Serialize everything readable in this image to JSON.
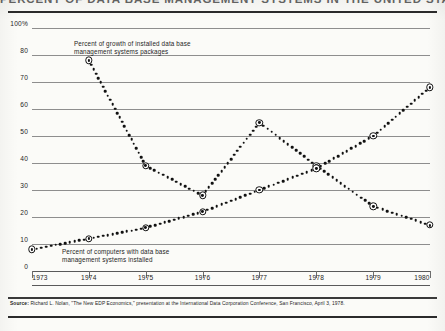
{
  "title": "PERCENT OF DATA BASE MANAGEMENT SYSTEMS IN THE UNITED STATES",
  "source_label": "Source:",
  "source_text": " Richard L. Nolan, \"The New EDP Economics,\" presentation at the International Data Corporation Conference, San Francisco, April 3, 1978.",
  "chart_data": {
    "type": "line",
    "title": "PERCENT OF DATA BASE MANAGEMENT SYSTEMS IN THE UNITED STATES",
    "xlabel": "",
    "ylabel": "",
    "xlim": [
      1973,
      1980
    ],
    "ylim": [
      0,
      100
    ],
    "grid": true,
    "legend_position": "inline-annotation",
    "x": [
      1973,
      1974,
      1975,
      1976,
      1977,
      1978,
      1979,
      1980
    ],
    "ytick_labels": [
      "0",
      "10",
      "20",
      "30",
      "40",
      "50",
      "60",
      "70",
      "80",
      "100%"
    ],
    "ytick_values": [
      0,
      10,
      20,
      30,
      40,
      50,
      60,
      70,
      80,
      100
    ],
    "xtick_labels": [
      "1973",
      "1974",
      "1975",
      "1976",
      "1977",
      "1978",
      "1979",
      "1980"
    ],
    "series": [
      {
        "name": "Percent of growth of installed data base management systems packages",
        "annotation": "Percent of growth of installed data base\nmanagement systems packages",
        "style": "dotted",
        "x": [
          1974,
          1975,
          1976,
          1977,
          1978,
          1979,
          1980
        ],
        "values": [
          78,
          39,
          28,
          55,
          39,
          24,
          17
        ]
      },
      {
        "name": "Percent of computers with data base management systems installed",
        "annotation": "Percent of computers with data base\nmanagement systems installed",
        "style": "dotted",
        "x": [
          1973,
          1974,
          1975,
          1976,
          1977,
          1978,
          1979,
          1980
        ],
        "values": [
          8,
          12,
          16,
          22,
          30,
          38,
          50,
          68
        ]
      }
    ]
  }
}
